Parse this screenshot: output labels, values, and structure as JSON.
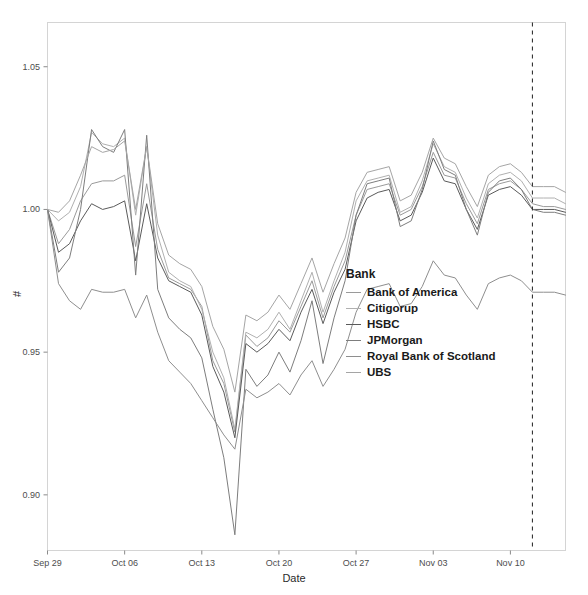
{
  "chart_data": {
    "type": "line",
    "title": "",
    "xlabel": "Date",
    "ylabel": "#",
    "ylim": [
      0.8805,
      1.0655
    ],
    "xlim": [
      0,
      47
    ],
    "grid": false,
    "legend_position": "inside-center-right",
    "legend_title": "Bank",
    "y_ticks": [
      "0.90",
      "0.95",
      "1.00",
      "1.05"
    ],
    "y_tick_values": [
      0.9,
      0.95,
      1.0,
      1.05
    ],
    "x_ticks": [
      "Sep 29",
      "Oct 06",
      "Oct 13",
      "Oct 20",
      "Oct 27",
      "Nov 03",
      "Nov 10"
    ],
    "x_tick_values": [
      0,
      7,
      14,
      21,
      28,
      35,
      42
    ],
    "annotations": [
      {
        "type": "vline",
        "x": 44,
        "style": "dashed",
        "color": "#333333"
      }
    ],
    "series": [
      {
        "name": "Bank of America",
        "color": "#9a9a9a",
        "values": [
          1.0,
          0.988,
          0.993,
          1.003,
          1.009,
          1.01,
          1.01,
          1.012,
          0.987,
          1.009,
          0.986,
          0.976,
          0.974,
          0.972,
          0.966,
          0.947,
          0.939,
          0.922,
          0.956,
          0.952,
          0.955,
          0.961,
          0.957,
          0.966,
          0.975,
          0.962,
          0.973,
          0.982,
          0.998,
          1.007,
          1.008,
          1.009,
          0.998,
          1.0,
          1.008,
          1.02,
          1.012,
          1.011,
          1.002,
          0.995,
          1.007,
          1.009,
          1.01,
          1.007,
          1.002,
          1.001,
          1.001,
          1.0
        ]
      },
      {
        "name": "Citigorup",
        "color": "#b0b0b0",
        "values": [
          1.0,
          0.996,
          0.999,
          1.008,
          1.027,
          1.023,
          1.022,
          1.025,
          0.998,
          1.022,
          0.991,
          0.978,
          0.975,
          0.973,
          0.965,
          0.95,
          0.941,
          0.923,
          0.957,
          0.955,
          0.958,
          0.964,
          0.958,
          0.968,
          0.978,
          0.964,
          0.975,
          0.985,
          1.003,
          1.01,
          1.011,
          1.012,
          0.999,
          1.001,
          1.01,
          1.023,
          1.015,
          1.013,
          1.004,
          0.997,
          1.009,
          1.012,
          1.013,
          1.01,
          1.004,
          1.004,
          1.004,
          1.002
        ]
      },
      {
        "name": "HSBC",
        "color": "#5a5a5a",
        "values": [
          1.0,
          0.985,
          0.988,
          0.996,
          1.002,
          1.0,
          1.001,
          1.003,
          0.982,
          1.002,
          0.983,
          0.975,
          0.973,
          0.971,
          0.963,
          0.945,
          0.936,
          0.92,
          0.953,
          0.95,
          0.953,
          0.958,
          0.954,
          0.964,
          0.972,
          0.96,
          0.971,
          0.979,
          0.996,
          1.004,
          1.006,
          1.007,
          0.996,
          0.998,
          1.006,
          1.018,
          1.01,
          1.009,
          1.0,
          0.993,
          1.005,
          1.007,
          1.008,
          1.005,
          1.0,
          1.0,
          1.0,
          0.999
        ]
      },
      {
        "name": "JPMorgan",
        "color": "#7d7d7d",
        "values": [
          1.0,
          0.978,
          0.983,
          1.0,
          1.028,
          1.022,
          1.02,
          1.028,
          0.977,
          1.026,
          0.972,
          0.962,
          0.958,
          0.955,
          0.948,
          0.93,
          0.913,
          0.886,
          0.944,
          0.938,
          0.942,
          0.95,
          0.943,
          0.954,
          0.968,
          0.946,
          0.962,
          0.975,
          0.998,
          1.009,
          1.01,
          1.011,
          0.994,
          0.996,
          1.007,
          1.024,
          1.014,
          1.012,
          1.0,
          0.991,
          1.006,
          1.01,
          1.011,
          1.007,
          1.0,
          0.999,
          0.999,
          0.998
        ]
      },
      {
        "name": "Royal Bank of Scotland",
        "color": "#8e8e8e",
        "values": [
          1.0,
          0.974,
          0.968,
          0.965,
          0.972,
          0.971,
          0.971,
          0.972,
          0.962,
          0.97,
          0.957,
          0.947,
          0.943,
          0.939,
          0.933,
          0.927,
          0.921,
          0.916,
          0.937,
          0.934,
          0.936,
          0.939,
          0.935,
          0.942,
          0.947,
          0.938,
          0.944,
          0.951,
          0.964,
          0.972,
          0.973,
          0.974,
          0.966,
          0.967,
          0.973,
          0.982,
          0.977,
          0.976,
          0.97,
          0.965,
          0.974,
          0.976,
          0.977,
          0.975,
          0.971,
          0.971,
          0.971,
          0.97
        ]
      },
      {
        "name": "UBS",
        "color": "#a5a5a5",
        "values": [
          1.0,
          0.999,
          1.003,
          1.012,
          1.022,
          1.02,
          1.021,
          1.024,
          1.0,
          1.022,
          0.995,
          0.984,
          0.981,
          0.979,
          0.973,
          0.959,
          0.951,
          0.936,
          0.963,
          0.961,
          0.964,
          0.97,
          0.965,
          0.974,
          0.983,
          0.971,
          0.981,
          0.99,
          1.006,
          1.013,
          1.014,
          1.015,
          1.003,
          1.005,
          1.013,
          1.025,
          1.018,
          1.016,
          1.008,
          1.001,
          1.012,
          1.015,
          1.016,
          1.013,
          1.008,
          1.008,
          1.008,
          1.006
        ]
      }
    ]
  },
  "axes": {
    "y_title": "#",
    "x_title": "Date"
  },
  "legend": {
    "title": "Bank",
    "items": [
      {
        "label": "Bank of America"
      },
      {
        "label": "Citigorup"
      },
      {
        "label": "HSBC"
      },
      {
        "label": "JPMorgan"
      },
      {
        "label": "Royal Bank of Scotland"
      },
      {
        "label": "UBS"
      }
    ]
  }
}
